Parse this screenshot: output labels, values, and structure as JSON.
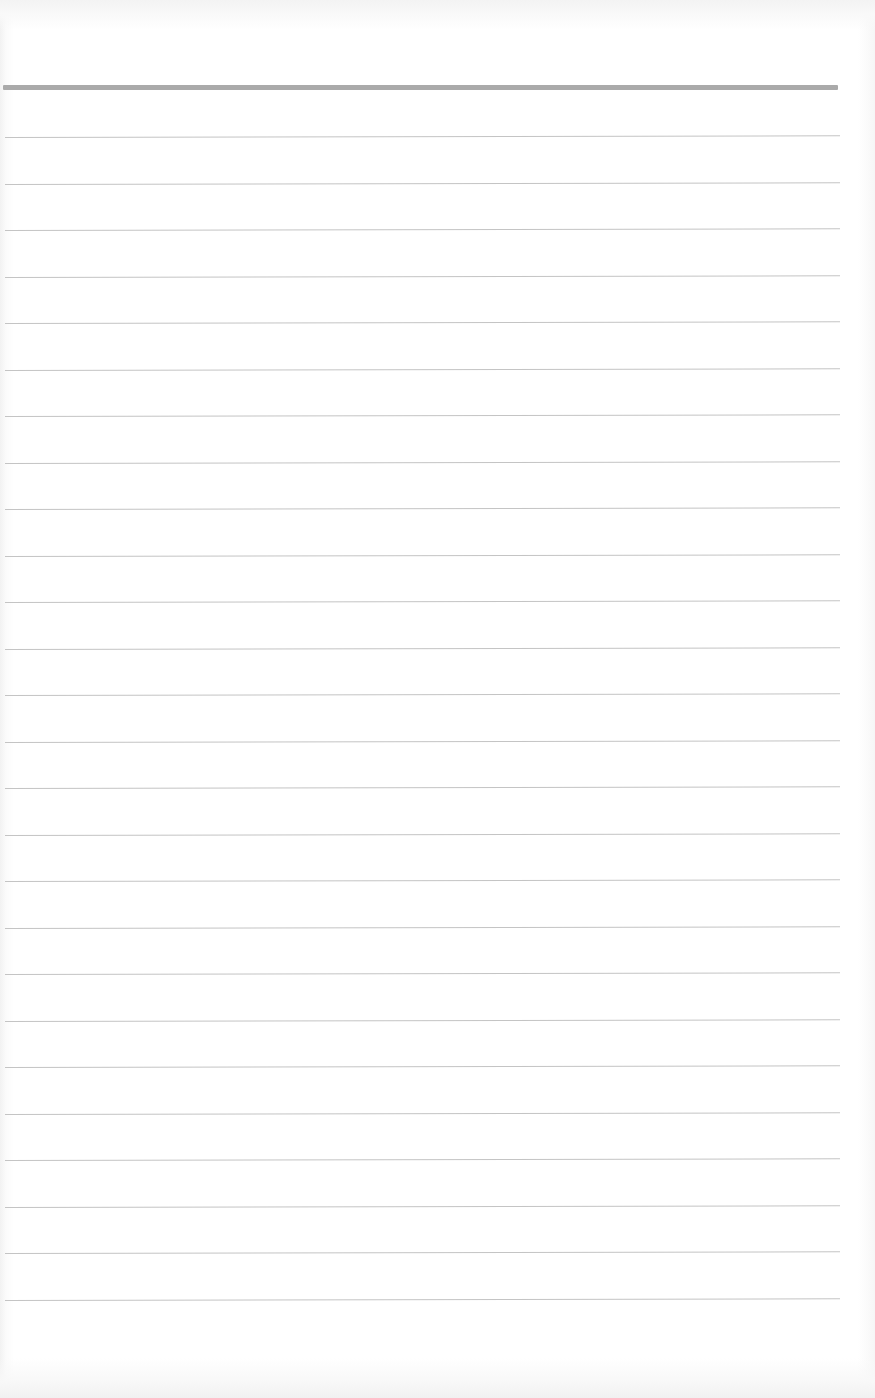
{
  "page": {
    "type": "ruled-notebook-page",
    "background_color": "#ffffff",
    "content_text": ""
  },
  "header_rule": {
    "top": 85,
    "left": 3,
    "right": 838,
    "thickness": 5,
    "color": "#aaaaaa"
  },
  "ruled_lines": {
    "count": 26,
    "first_top": 137,
    "spacing": 46.5,
    "left": 5,
    "right": 840,
    "color": "#c4c4c4",
    "slant_deg": -0.12
  }
}
